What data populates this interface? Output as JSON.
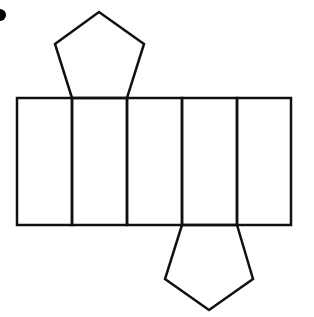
{
  "diagram": {
    "type": "net-of-pentagonal-prism",
    "stroke_color": "#111111",
    "background": "#ffffff",
    "stroke_width": 2.5,
    "bullet": {
      "cx": 0,
      "cy": 15,
      "r": 6,
      "color": "#000000"
    },
    "lateral_strip": {
      "x": 17,
      "y": 98,
      "width": 274,
      "height": 127
    },
    "dividers_x": [
      72,
      127,
      182,
      237
    ],
    "top_pentagon": {
      "points": "72,98 55,44 99,12 144,44 127,98",
      "attached_to_face": 2
    },
    "bottom_pentagon": {
      "points": "182,225 165,279 209,310 253,279 237,225",
      "attached_to_face": 4
    },
    "face_count": 5
  }
}
